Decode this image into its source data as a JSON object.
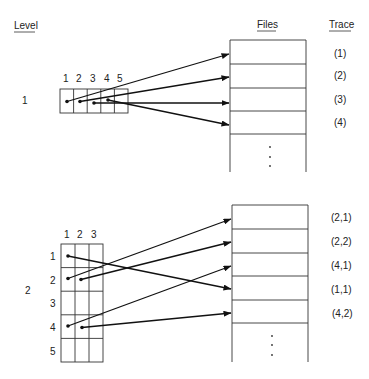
{
  "headers": {
    "level": "Level",
    "files": "Files",
    "trace": "Trace"
  },
  "level1": {
    "label": "1",
    "columns": [
      "1",
      "2",
      "3",
      "4",
      "5"
    ],
    "traces": [
      "(1)",
      "(2)",
      "(3)",
      "(4)"
    ],
    "pointers": [
      {
        "from_col": 1,
        "to_row": 1
      },
      {
        "from_col": 2,
        "to_row": 2
      },
      {
        "from_col": 3,
        "to_row": 3
      },
      {
        "from_col": 4,
        "to_row": 4
      }
    ]
  },
  "level2": {
    "label": "2",
    "columns": [
      "1",
      "2",
      "3"
    ],
    "rows": [
      "1",
      "2",
      "3",
      "4",
      "5"
    ],
    "traces": [
      "(2,1)",
      "(2,2)",
      "(4,1)",
      "(1,1)",
      "(4,2)"
    ],
    "pointers": [
      {
        "from": "(1,1)",
        "to_row": 4
      },
      {
        "from": "(2,1)",
        "to_row": 1
      },
      {
        "from": "(2,2)",
        "to_row": 2
      },
      {
        "from": "(4,1)",
        "to_row": 3
      },
      {
        "from": "(4,2)",
        "to_row": 5
      }
    ]
  },
  "ellipsis": "⋮"
}
